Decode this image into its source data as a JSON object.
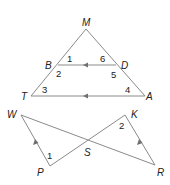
{
  "figure": {
    "triangle": {
      "vertices": {
        "M": {
          "label": "M",
          "x": 86,
          "y": 29
        },
        "B": {
          "label": "B",
          "x": 58,
          "y": 65
        },
        "D": {
          "label": "D",
          "x": 116,
          "y": 65
        },
        "T": {
          "label": "T",
          "x": 31,
          "y": 96
        },
        "A": {
          "label": "A",
          "x": 145,
          "y": 96
        }
      },
      "angles": [
        "1",
        "2",
        "3",
        "4",
        "5",
        "6"
      ],
      "parallel_segments": [
        "BD",
        "TA"
      ]
    },
    "crossed": {
      "vertices": {
        "W": {
          "label": "W",
          "x": 21,
          "y": 115
        },
        "P": {
          "label": "P",
          "x": 50,
          "y": 166
        },
        "S": {
          "label": "S",
          "x": 88,
          "y": 140
        },
        "K": {
          "label": "K",
          "x": 125,
          "y": 115
        },
        "R": {
          "label": "R",
          "x": 155,
          "y": 165
        }
      },
      "angles": [
        "1",
        "2"
      ],
      "parallel_segments": [
        "WP",
        "KR"
      ]
    }
  },
  "colors": {
    "line": "#8a8a8a",
    "arrow": "#6f6f6f",
    "text": "#222222"
  }
}
